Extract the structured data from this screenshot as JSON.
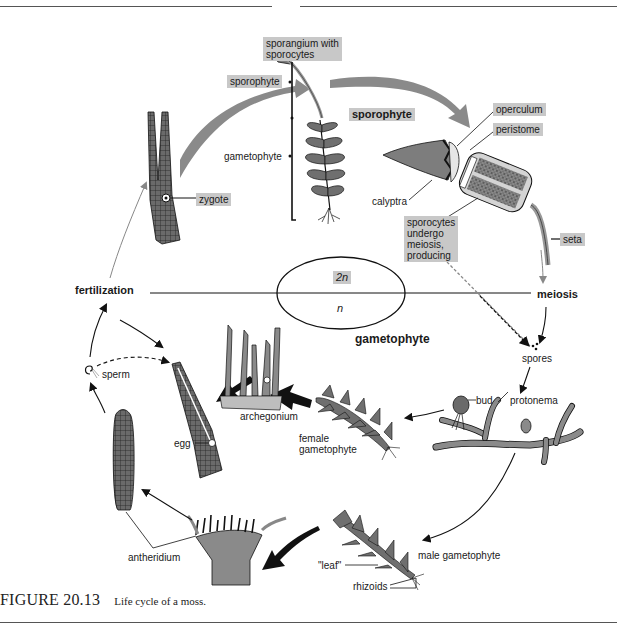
{
  "figure": {
    "number": "FIGURE 20.13",
    "caption": "Life cycle of a moss."
  },
  "divider": {
    "upper": {
      "label": "2n"
    },
    "lower": {
      "label": "n"
    },
    "left_event": "fertilization",
    "right_event": "meiosis"
  },
  "phases": {
    "sporophyte": "sporophyte",
    "gametophyte": "gametophyte"
  },
  "labels": {
    "sporangium": "sporangium with sporocytes",
    "sporangium_line1": "sporangium with",
    "sporangium_line2": "sporocytes",
    "sporophyte_bracket": "sporophyte",
    "gametophyte_bracket": "gametophyte",
    "zygote": "zygote",
    "operculum": "operculum",
    "peristome": "peristome",
    "calyptra": "calyptra",
    "sporocytes_note_1": "sporocytes",
    "sporocytes_note_2": "undergo",
    "sporocytes_note_3": "meiosis,",
    "sporocytes_note_4": "producing",
    "seta": "seta",
    "spores": "spores",
    "bud": "bud",
    "protonema": "protonema",
    "archegonium": "archegonium",
    "female_gametophyte_1": "female",
    "female_gametophyte_2": "gametophyte",
    "egg": "egg",
    "sperm": "sperm",
    "antheridium": "antheridium",
    "leaf": "\"leaf\"",
    "rhizoids": "rhizoids",
    "male_gametophyte": "male gametophyte"
  },
  "colors": {
    "label_box": "#c8c8c8",
    "big_arrow": "#8a8a8a",
    "plant_fill": "#7d7d7d",
    "line": "#111111"
  }
}
